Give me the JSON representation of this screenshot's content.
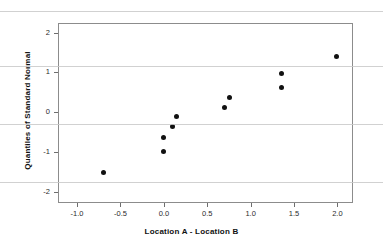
{
  "chart_data": {
    "type": "scatter",
    "title": "",
    "xlabel": "Location A - Location B",
    "ylabel": "Quantiles of Standard Normal",
    "xlim": [
      -1.22,
      2.18
    ],
    "ylim": [
      -2.28,
      2.24
    ],
    "xticks": [
      "-1.0",
      "-0.5",
      "0.0",
      "0.5",
      "1.0",
      "1.5",
      "2.0"
    ],
    "xtick_values": [
      -1.0,
      -0.5,
      0.0,
      0.5,
      1.0,
      1.5,
      2.0
    ],
    "yticks": [
      "2",
      "1",
      "0",
      "-1",
      "-2"
    ],
    "ytick_values": [
      2,
      1,
      0,
      -1,
      -2
    ],
    "grid": false,
    "legend": null,
    "marker": "filled-circle",
    "marker_color": "#111111",
    "points": [
      {
        "x": -0.69,
        "y": -1.52
      },
      {
        "x": 0.0,
        "y": -0.98
      },
      {
        "x": 0.0,
        "y": -0.63
      },
      {
        "x": 0.1,
        "y": -0.37
      },
      {
        "x": 0.15,
        "y": -0.11
      },
      {
        "x": 0.7,
        "y": 0.11
      },
      {
        "x": 0.76,
        "y": 0.37
      },
      {
        "x": 1.36,
        "y": 0.62
      },
      {
        "x": 1.36,
        "y": 0.96
      },
      {
        "x": 1.99,
        "y": 1.4
      }
    ],
    "artifact_lines_y": [
      11,
      66,
      124,
      182
    ]
  }
}
